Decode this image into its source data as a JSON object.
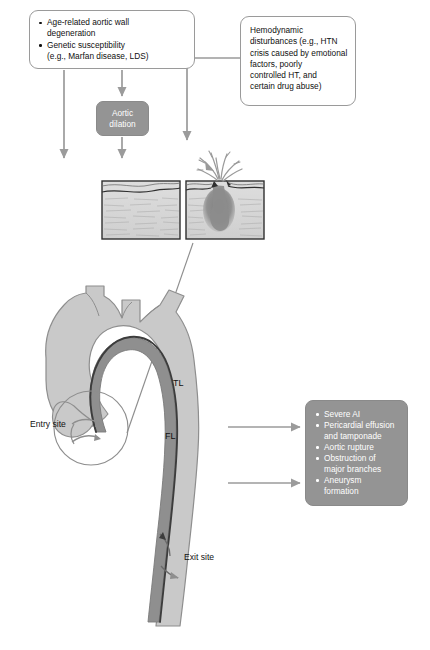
{
  "figure": {
    "background_color": "#ffffff"
  },
  "colors": {
    "box_border": "#9a9a9a",
    "gray_box_fill": "#949494",
    "gray_box_text": "#ffffff",
    "arrow": "#9b9b9b",
    "aorta_light": "#c9c9c9",
    "aorta_outline": "#8e8e8e",
    "false_lumen_dark": "#8f8f8f",
    "intimal_flap": "#3c3c3c",
    "tissue_fill": "#d6d6d6",
    "tissue_border": "#3a3a3a",
    "tear_blood": "#8c8c8c",
    "text": "#101010"
  },
  "risk_factors_box": {
    "name": "risk-factors",
    "items": [
      "Age-related aortic wall degeneration",
      "Genetic susceptibility (e.g., Marfan disease, LDS)"
    ],
    "item_lines": [
      [
        "Age-related aortic wall",
        "degeneration"
      ],
      [
        "Genetic susceptibility",
        "(e.g., Marfan disease, LDS)"
      ]
    ]
  },
  "hemodynamic_box": {
    "name": "hemodynamic-disturbances",
    "text": "Hemodynamic disturbances (e.g., HTN crisis caused by emotional factors, poorly controlled HT, and certain drug abuse)",
    "lines": [
      "Hemodynamic",
      "disturbances (e.g., HTN",
      "crisis caused by emotional",
      "factors, poorly",
      "controlled HT, and",
      "certain drug abuse)"
    ]
  },
  "aortic_dilation_box": {
    "name": "aortic-dilation",
    "text": "Aortic dilation",
    "lines": [
      "Aortic",
      "dilation"
    ]
  },
  "complications_box": {
    "name": "complications",
    "items": [
      "Severe AI",
      "Pericardial effusion and tamponade",
      "Aortic rupture",
      "Obstruction of major branches",
      "Aneurysm formation"
    ],
    "item_lines": [
      [
        "Severe AI"
      ],
      [
        "Pericardial effusion",
        "and tamponade"
      ],
      [
        "Aortic rupture"
      ],
      [
        "Obstruction of",
        "major branches"
      ],
      [
        "Aneurysm",
        "formation"
      ]
    ]
  },
  "anatomy_labels": {
    "true_lumen": "TL",
    "false_lumen": "FL",
    "entry_site": "Entry site",
    "exit_site": "Exit site"
  },
  "histology_panels": {
    "normal_wall": {
      "name": "normal-aortic-wall-block",
      "caption": ""
    },
    "intimal_tear": {
      "name": "intimal-tear-block",
      "caption": ""
    }
  },
  "arrows": [
    {
      "name": "risk-factors-to-aortic-dilation",
      "direction": "down"
    },
    {
      "name": "risk-factors-to-histology-left",
      "direction": "down"
    },
    {
      "name": "aortic-dilation-to-histology",
      "direction": "down"
    },
    {
      "name": "hemodynamic-to-histology-right",
      "direction": "down"
    },
    {
      "name": "aorta-to-complications-upper",
      "direction": "right"
    },
    {
      "name": "aorta-to-complications-lower",
      "direction": "right"
    }
  ]
}
